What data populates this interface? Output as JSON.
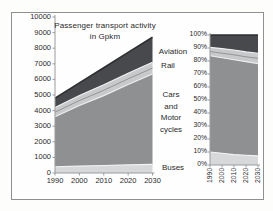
{
  "figure": {
    "title_line1": "Passenger transport activity",
    "title_line2": "in Gpkm",
    "labels": {
      "aviation": "Aviation",
      "rail": "Rail",
      "cars_1": "Cars",
      "cars_2": "and",
      "cars_3": "Motor",
      "cars_4": "cycles",
      "buses": "Buses"
    }
  },
  "chart_data": [
    {
      "type": "area",
      "stacked": true,
      "name": "absolute-activity",
      "title": "Passenger transport activity in Gpkm",
      "x": [
        1990,
        2000,
        2010,
        2020,
        2030
      ],
      "xticks": [
        "1990",
        "2000",
        "2010",
        "2020",
        "2030"
      ],
      "series": [
        {
          "name": "Buses",
          "color": "#d6d8da",
          "values": [
            400,
            440,
            480,
            520,
            550
          ]
        },
        {
          "name": "Cars and Motor cycles",
          "color": "#8e9092",
          "values": [
            3200,
            3880,
            4480,
            5150,
            5800
          ]
        },
        {
          "name": "Rail",
          "color": "#c7c9cb",
          "values": [
            600,
            650,
            690,
            730,
            750
          ]
        },
        {
          "name": "Aviation",
          "color": "#47494c",
          "values": [
            600,
            805,
            1100,
            1330,
            1600
          ]
        }
      ],
      "ylim": [
        0,
        10000
      ],
      "yticks": [
        "0",
        "1000",
        "2000",
        "3000",
        "4000",
        "5000",
        "6000",
        "7000",
        "8000",
        "9000",
        "10000"
      ],
      "grid": false,
      "legend_position": "right-annotations"
    },
    {
      "type": "area",
      "stacked": "percent",
      "name": "share-of-activity",
      "title": "",
      "x": [
        1990,
        2000,
        2010,
        2020,
        2030
      ],
      "xticks": [
        "1990",
        "2000",
        "2010",
        "2020",
        "2030"
      ],
      "series": [
        {
          "name": "Buses",
          "color": "#d6d8da",
          "values": [
            10,
            9,
            8,
            7.5,
            7
          ]
        },
        {
          "name": "Cars and Motor cycles",
          "color": "#8e9092",
          "values": [
            74,
            73.5,
            73,
            72,
            71
          ]
        },
        {
          "name": "Rail",
          "color": "#c7c9cb",
          "values": [
            6.5,
            7,
            7.5,
            7.5,
            8
          ]
        },
        {
          "name": "Aviation",
          "color": "#47494c",
          "values": [
            9.5,
            10.5,
            11.5,
            13,
            14
          ]
        }
      ],
      "ylim": [
        0,
        100
      ],
      "yticks": [
        "0%",
        "10%",
        "20%",
        "30%",
        "40%",
        "50%",
        "60%",
        "70%",
        "80%",
        "90%",
        "100%"
      ],
      "grid": false,
      "legend_position": "none"
    }
  ]
}
